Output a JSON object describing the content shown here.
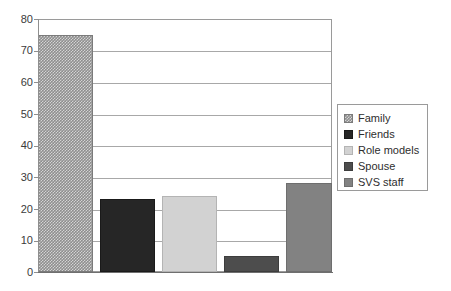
{
  "chart_data": {
    "type": "bar",
    "title": "",
    "subtitle": "",
    "xlabel": "",
    "ylabel": "",
    "ylim": [
      0,
      80
    ],
    "ytick_step": 10,
    "yticks": [
      80,
      70,
      60,
      50,
      40,
      30,
      20,
      10,
      0
    ],
    "ytick_labels": [
      "80",
      "70",
      "60",
      "50",
      "40",
      "30",
      "20",
      "10",
      "0"
    ],
    "xticks": [],
    "xtick_labels": [],
    "grid": "horizontal",
    "legend_position": "right",
    "categories": [
      "Family",
      "Friends",
      "Role models",
      "Spouse",
      "SVS staff"
    ],
    "values": [
      75,
      23,
      24,
      5,
      28
    ],
    "series": [
      {
        "name": "Family",
        "value": 75,
        "fill": "#8e8e8e",
        "pattern": "checkered",
        "border": "#7b7b7b"
      },
      {
        "name": "Friends",
        "value": 23,
        "fill": "#262626",
        "pattern": "solid",
        "border": "#1a1a1a"
      },
      {
        "name": "Role models",
        "value": 24,
        "fill": "#d2d2d2",
        "pattern": "solid",
        "border": "#b4b4b4"
      },
      {
        "name": "Spouse",
        "value": 5,
        "fill": "#4d4d4d",
        "pattern": "solid",
        "border": "#3d3d3d"
      },
      {
        "name": "SVS staff",
        "value": 28,
        "fill": "#828282",
        "pattern": "solid",
        "border": "#6e6e6e"
      }
    ],
    "annotations": [],
    "colors": {
      "background": "#ffffff",
      "gridline": "#a8a8a8",
      "axis": "#8f8f8f",
      "plot_border": "#9a9a9a",
      "tick_text": "#3b3b3b",
      "legend_text": "#2e2e2e",
      "legend_border": "#9a9a9a"
    }
  },
  "legend": {
    "entries": [
      {
        "label": "Family"
      },
      {
        "label": "Friends"
      },
      {
        "label": "Role models"
      },
      {
        "label": "Spouse"
      },
      {
        "label": "SVS staff"
      }
    ]
  }
}
